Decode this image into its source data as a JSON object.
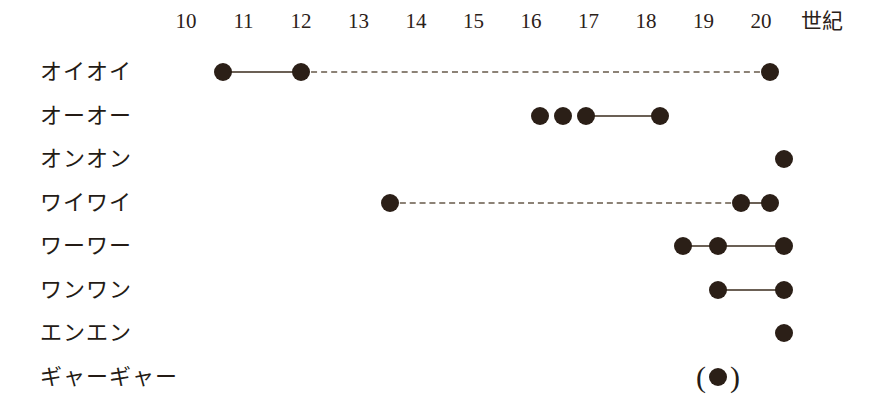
{
  "chart_data": {
    "type": "table",
    "title": "",
    "xlabel": "世紀",
    "ylabel": "",
    "xlim": [
      9.6,
      20.6
    ],
    "grid": false,
    "legend": "none",
    "axis": {
      "unit_label": "世紀",
      "ticks": [
        {
          "label": "10",
          "value": 10
        },
        {
          "label": "11",
          "value": 11
        },
        {
          "label": "12",
          "value": 12
        },
        {
          "label": "13",
          "value": 13
        },
        {
          "label": "14",
          "value": 14
        },
        {
          "label": "15",
          "value": 15
        },
        {
          "label": "16",
          "value": 16
        },
        {
          "label": "17",
          "value": 17
        },
        {
          "label": "18",
          "value": 18
        },
        {
          "label": "19",
          "value": 19
        },
        {
          "label": "20",
          "value": 20
        }
      ]
    },
    "categories": [
      "オイオイ",
      "オーオー",
      "オンオン",
      "ワイワイ",
      "ワーワー",
      "ワンワン",
      "エンエン",
      "ギャーギャー"
    ],
    "rows": [
      {
        "label": "オイオイ",
        "points": [
          10.65,
          12.0,
          20.15
        ],
        "uncertain": [],
        "segments": [
          {
            "from": 10.65,
            "to": 12.0,
            "style": "solid"
          },
          {
            "from": 12.0,
            "to": 20.15,
            "style": "dashed"
          }
        ]
      },
      {
        "label": "オーオー",
        "points": [
          16.15,
          16.55,
          16.95,
          18.25
        ],
        "uncertain": [],
        "segments": [
          {
            "from": 16.95,
            "to": 18.25,
            "style": "solid"
          }
        ]
      },
      {
        "label": "オンオン",
        "points": [
          20.4
        ],
        "uncertain": [],
        "segments": []
      },
      {
        "label": "ワイワイ",
        "points": [
          13.55,
          19.65,
          20.15
        ],
        "uncertain": [],
        "segments": [
          {
            "from": 13.55,
            "to": 19.65,
            "style": "dashed"
          },
          {
            "from": 19.65,
            "to": 20.15,
            "style": "solid"
          }
        ]
      },
      {
        "label": "ワーワー",
        "points": [
          18.65,
          19.25,
          20.4
        ],
        "uncertain": [],
        "segments": [
          {
            "from": 18.65,
            "to": 19.25,
            "style": "solid"
          },
          {
            "from": 19.25,
            "to": 20.4,
            "style": "solid"
          }
        ]
      },
      {
        "label": "ワンワン",
        "points": [
          19.25,
          20.4
        ],
        "uncertain": [],
        "segments": [
          {
            "from": 19.25,
            "to": 20.4,
            "style": "solid"
          }
        ]
      },
      {
        "label": "エンエン",
        "points": [
          20.4
        ],
        "uncertain": [],
        "segments": []
      },
      {
        "label": "ギャーギャー",
        "points": [],
        "uncertain": [
          19.25
        ],
        "segments": []
      }
    ]
  },
  "style": {
    "dot_color": "#2b1f17",
    "line_color": "#6b6055",
    "dash_color": "#8c8276",
    "text_color": "#241b15",
    "background": "#ffffff"
  },
  "geometry": {
    "x_at_century_10": 186,
    "px_per_century": 57.5,
    "unit_label_x": 822,
    "first_row_center_y": 72,
    "row_spacing": 43.5
  },
  "marks": {
    "paren_left": "(",
    "paren_right": ")"
  }
}
